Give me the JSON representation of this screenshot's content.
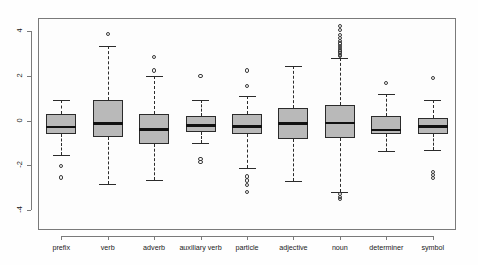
{
  "chart_data": {
    "type": "box",
    "title": "",
    "xlabel": "",
    "ylabel": "",
    "ylim": [
      -4.9,
      4.6
    ],
    "grid": false,
    "legend": null,
    "y_ticks": [
      -4,
      -2,
      0,
      2,
      4
    ],
    "y_tick_labels": [
      "-4",
      "-2",
      "0",
      "2",
      "4"
    ],
    "categories": [
      "prefix",
      "verb",
      "adverb",
      "auxiliary verb",
      "particle",
      "adjective",
      "noun",
      "determiner",
      "symbol"
    ],
    "boxes": [
      {
        "label": "prefix",
        "whisker_low": -1.55,
        "q1": -0.62,
        "median": -0.28,
        "q3": 0.3,
        "whisker_high": 0.92,
        "outliers": [
          -2.05,
          -2.55
        ]
      },
      {
        "label": "verb",
        "whisker_low": -2.82,
        "q1": -0.72,
        "median": -0.12,
        "q3": 0.92,
        "whisker_high": 3.35,
        "outliers": [
          3.9
        ]
      },
      {
        "label": "adverb",
        "whisker_low": -2.65,
        "q1": -1.05,
        "median": -0.38,
        "q3": 0.3,
        "whisker_high": 2.0,
        "outliers": [
          2.85,
          2.25
        ]
      },
      {
        "label": "auxiliary verb",
        "whisker_low": -0.98,
        "q1": -0.5,
        "median": -0.2,
        "q3": 0.22,
        "whisker_high": 0.92,
        "outliers": [
          2.0,
          -1.72,
          -1.85
        ]
      },
      {
        "label": "particle",
        "whisker_low": -2.1,
        "q1": -0.62,
        "median": -0.25,
        "q3": 0.3,
        "whisker_high": 1.12,
        "outliers": [
          2.25,
          1.55,
          -2.5,
          -2.68,
          -2.88,
          -3.2
        ]
      },
      {
        "label": "adjective",
        "whisker_low": -2.7,
        "q1": -0.82,
        "median": -0.12,
        "q3": 0.55,
        "whisker_high": 2.45,
        "outliers": []
      },
      {
        "label": "noun",
        "whisker_low": -3.2,
        "q1": -0.78,
        "median": -0.1,
        "q3": 0.72,
        "whisker_high": 2.8,
        "outliers": [
          4.25,
          4.05,
          3.85,
          3.7,
          3.58,
          3.46,
          3.36,
          3.26,
          3.18,
          3.1,
          3.02,
          2.95,
          2.88,
          -3.3,
          -3.42,
          -3.5
        ]
      },
      {
        "label": "determiner",
        "whisker_low": -1.35,
        "q1": -0.58,
        "median": -0.42,
        "q3": 0.2,
        "whisker_high": 1.2,
        "outliers": [
          1.7
        ]
      },
      {
        "label": "symbol",
        "whisker_low": -1.3,
        "q1": -0.6,
        "median": -0.25,
        "q3": 0.12,
        "whisker_high": 0.92,
        "outliers": [
          1.9,
          -2.3,
          -2.42,
          -2.58
        ]
      }
    ],
    "colors": {
      "box_fill": "#b9b9b9",
      "box_border": "#2b2b2b",
      "median": "#111111",
      "whisker": "#2b2b2b",
      "outlier": "#3a3a3a",
      "axis": "#7a7a7a",
      "background": "#fdfdfd"
    }
  }
}
